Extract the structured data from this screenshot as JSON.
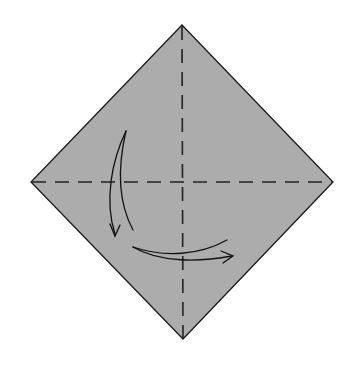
{
  "diagram": {
    "type": "origami-step",
    "colors": {
      "background": "#ffffff",
      "paper_fill": "#acacac",
      "outline": "#1a1a1a",
      "crease": "#222222",
      "arrow": "#111111"
    },
    "paper": {
      "shape": "diamond",
      "vertices": {
        "top": [
          182,
          25
        ],
        "right": [
          333,
          182
        ],
        "bottom": [
          183,
          339
        ],
        "left": [
          31,
          182
        ]
      }
    },
    "creases": [
      {
        "name": "vertical-crease",
        "style": "dashed",
        "from": [
          182,
          25
        ],
        "to": [
          183,
          339
        ]
      },
      {
        "name": "horizontal-crease",
        "style": "dashed",
        "from": [
          31,
          182
        ],
        "to": [
          333,
          182
        ]
      }
    ],
    "arrows": [
      {
        "name": "down-curved-arrow",
        "direction": "down",
        "start": [
          126,
          131
        ],
        "end": [
          115,
          236
        ]
      },
      {
        "name": "right-curved-arrow",
        "direction": "right",
        "start": [
          133,
          247
        ],
        "end": [
          233,
          258
        ]
      }
    ]
  }
}
